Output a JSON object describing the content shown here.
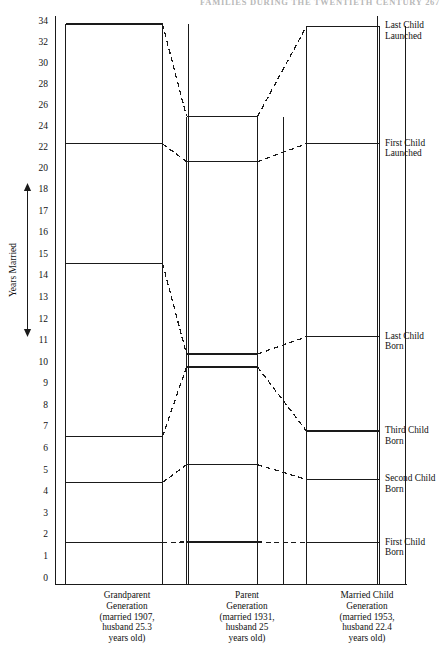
{
  "running_head": "FAMILIES DURING THE TWENTIETH CENTURY   267",
  "axis": {
    "title": "Years Married",
    "ticks": [
      34,
      32,
      30,
      28,
      26,
      24,
      22,
      20,
      18,
      17,
      16,
      15,
      14,
      13,
      12,
      11,
      10,
      9,
      8,
      7,
      6,
      5,
      4,
      3,
      2,
      1,
      0
    ]
  },
  "generations": [
    {
      "name": "Grandparent Generation",
      "caption_lines": [
        "Grandparent",
        "Generation",
        "(married 1907,",
        "husband 25.3",
        "years old)"
      ],
      "values": [
        33.8,
        22.4,
        14.6,
        6.58,
        4.45,
        1.67
      ]
    },
    {
      "name": "Parent Generation",
      "caption_lines": [
        "Parent",
        "Generation",
        "(married 1931,",
        "husband 25",
        "years old)"
      ],
      "values": [
        25.0,
        20.7,
        10.4,
        9.8,
        5.27,
        1.69
      ]
    },
    {
      "name": "Married Child Generation",
      "caption_lines": [
        "Married Child",
        "Generation",
        "(married 1953,",
        "husband 22.4",
        "years old)"
      ],
      "values": [
        33.6,
        22.4,
        11.2,
        6.83,
        4.59,
        1.66
      ]
    }
  ],
  "event_labels": [
    {
      "line1": "Last Child",
      "line2": "Launched"
    },
    {
      "line1": "First Child",
      "line2": "Launched"
    },
    {
      "line1": "Last Child",
      "line2": "Born"
    },
    {
      "line1": "Third Child",
      "line2": "Born"
    },
    {
      "line1": "Second Child",
      "line2": "Born"
    },
    {
      "line1": "First Child",
      "line2": "Born"
    }
  ],
  "chart_data": {
    "type": "line",
    "xlabel": "",
    "ylabel": "Years Married",
    "ylim": [
      0,
      34
    ],
    "grid": false,
    "legend_position": "right",
    "note": "Non-linear y-axis: 1-unit ticks from 0 to 18, 2-unit ticks from 18 to 34. Each column is a stacked set of open boxes whose top edges mark family life-cycle events; dashed lines connect the same event across generations to the right-hand event labels.",
    "categories": [
      "Grandparent Generation (married 1907, husband 25.3 years old)",
      "Parent Generation (married 1931, husband 25 years old)",
      "Married Child Generation (married 1953, husband 22.4 years old)"
    ],
    "series": [
      {
        "name": "First Child Born",
        "values": [
          1.67,
          1.69,
          1.66
        ]
      },
      {
        "name": "Second Child Born",
        "values": [
          4.45,
          5.27,
          4.59
        ]
      },
      {
        "name": "Third Child Born",
        "values": [
          6.58,
          null,
          6.83
        ]
      },
      {
        "name": "Last Child Born",
        "values": [
          14.6,
          10.4,
          11.2
        ]
      },
      {
        "name": "Child-rearing marker",
        "values": [
          null,
          9.8,
          null
        ]
      },
      {
        "name": "First Child Launched",
        "values": [
          22.4,
          20.7,
          22.4
        ]
      },
      {
        "name": "Last Child Launched",
        "values": [
          33.8,
          25.0,
          33.6
        ]
      }
    ]
  }
}
